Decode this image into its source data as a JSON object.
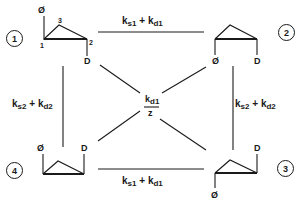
{
  "states": [
    {
      "id": "1",
      "label": "1",
      "substituents": {
        "top_left": "Ø",
        "bottom_right": "D"
      },
      "atom_numbers": [
        "1",
        "2",
        "3"
      ]
    },
    {
      "id": "2",
      "label": "2",
      "substituents": {
        "bottom_left": "Ø",
        "bottom_right": "D"
      }
    },
    {
      "id": "3",
      "label": "3",
      "substituents": {
        "bottom_left": "Ø",
        "top_right": "D"
      }
    },
    {
      "id": "4",
      "label": "4",
      "substituents": {
        "top_left": "Ø",
        "top_right": "D"
      }
    }
  ],
  "atoms": {
    "phi": "Ø",
    "deuterium": "D",
    "n1": "1",
    "n2": "2",
    "n3": "3"
  },
  "edges": {
    "top": {
      "k1": "k",
      "s1": "s1",
      "plus": " + ",
      "k2": "k",
      "d1": "d1"
    },
    "bottom": {
      "k1": "k",
      "s1": "s1",
      "plus": " + ",
      "k2": "k",
      "d1": "d1"
    },
    "left": {
      "k1": "k",
      "s2": "s2",
      "plus": " + ",
      "k2": "k",
      "d2": "d2"
    },
    "right": {
      "k1": "k",
      "s2": "s2",
      "plus": " + ",
      "k2": "k",
      "d2": "d2"
    },
    "diagonal": {
      "numerator_k": "k",
      "numerator_sub": "d1",
      "denominator": "z"
    }
  }
}
